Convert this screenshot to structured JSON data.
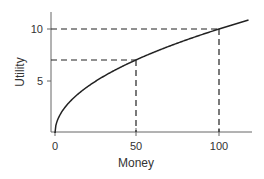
{
  "chart_data": {
    "type": "line",
    "title": "",
    "xlabel": "Money",
    "ylabel": "Utility",
    "xlim": [
      0,
      120
    ],
    "ylim": [
      0,
      12
    ],
    "grid": false,
    "legend": null,
    "x_ticks": [
      0,
      50,
      100
    ],
    "y_ticks": [
      5,
      10
    ],
    "x_tick_labels": [
      "0",
      "50",
      "100"
    ],
    "y_tick_labels": [
      "5",
      "10"
    ],
    "series": [
      {
        "name": "Utility function",
        "description": "Concave utility curve, U = sqrt(Money)",
        "x": [
          0,
          1,
          2,
          5,
          10,
          20,
          30,
          40,
          50,
          60,
          70,
          80,
          90,
          100,
          110,
          118
        ],
        "y": [
          0,
          1.0,
          1.41,
          2.24,
          3.16,
          4.47,
          5.48,
          6.32,
          7.07,
          7.75,
          8.37,
          8.94,
          9.49,
          10.0,
          10.49,
          10.86
        ]
      }
    ],
    "annotations": [
      {
        "type": "dashed-guide",
        "x": 50,
        "y": 7,
        "description": "Money 50 maps to Utility ~7"
      },
      {
        "type": "dashed-guide",
        "x": 100,
        "y": 10,
        "description": "Money 100 maps to Utility 10"
      }
    ]
  },
  "labels": {
    "xlabel": "Money",
    "ylabel": "Utility",
    "xtick_0": "0",
    "xtick_50": "50",
    "xtick_100": "100",
    "ytick_5": "5",
    "ytick_10": "10"
  },
  "colors": {
    "axis": "#555555",
    "curve": "#222222",
    "guide": "#222222",
    "text": "#333333"
  }
}
